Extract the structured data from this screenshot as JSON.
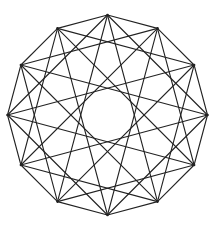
{
  "diagram": {
    "type": "star-polygon-compound",
    "vertices": 12,
    "chord_steps": [
      1,
      3,
      5
    ],
    "center": [
      107.5,
      115
    ],
    "radius": 100,
    "stroke_color": "#222222",
    "background": "#ffffff"
  }
}
